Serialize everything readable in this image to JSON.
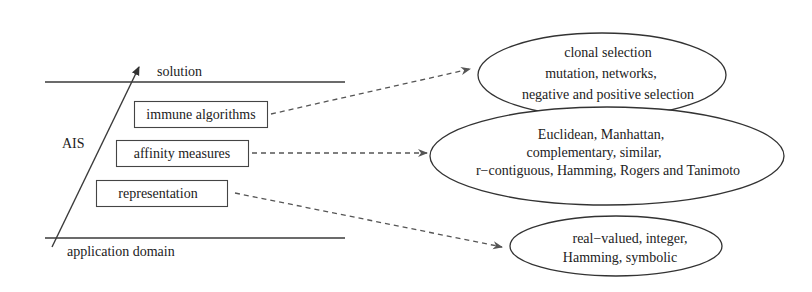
{
  "diagram": {
    "axis": {
      "label": "AIS",
      "top_label": "solution",
      "bottom_label": "application domain"
    },
    "layers": [
      {
        "label": "immune algorithms"
      },
      {
        "label": "affinity measures"
      },
      {
        "label": "representation"
      }
    ],
    "ellipses": [
      {
        "for_layer": "immune algorithms",
        "lines": [
          "clonal selection",
          "mutation, networks,",
          "negative and positive selection"
        ]
      },
      {
        "for_layer": "affinity measures",
        "lines": [
          "Euclidean, Manhattan,",
          "complementary, similar,",
          "r−contiguous, Hamming, Rogers and Tanimoto"
        ]
      },
      {
        "for_layer": "representation",
        "lines": [
          "real−valued, integer,",
          "Hamming, symbolic"
        ]
      }
    ],
    "colors": {
      "line": "#3a3a3a",
      "text": "#222222",
      "background": "#ffffff"
    }
  }
}
